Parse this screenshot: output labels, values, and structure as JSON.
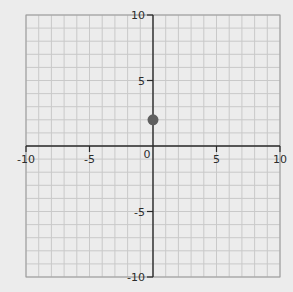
{
  "chart_data": {
    "type": "line",
    "title": "",
    "xlabel": "",
    "ylabel": "",
    "xlim": [
      -10,
      10
    ],
    "ylim": [
      -10,
      10
    ],
    "grid": true,
    "grid_step": 1,
    "x_ticks": [
      -10,
      -5,
      0,
      5,
      10
    ],
    "y_ticks": [
      -10,
      -5,
      5,
      10
    ],
    "x_tick_labels": [
      "-10",
      "-5",
      "0",
      "5",
      "10"
    ],
    "y_tick_labels": [
      "-10",
      "-5",
      "5",
      "10"
    ],
    "origin_label": "0",
    "series": [
      {
        "name": "horizontal line y = 2",
        "kind": "line",
        "x": [
          -10,
          9.5
        ],
        "y": [
          2,
          2
        ],
        "color": "#5a5a5a"
      },
      {
        "name": "point",
        "kind": "point",
        "x": [
          0
        ],
        "y": [
          2
        ],
        "color": "#5f5f5f"
      }
    ],
    "legend": null
  },
  "colors": {
    "background": "#ececec",
    "grid": "#c9c9c9",
    "axis": "#2a2a2a",
    "line": "#5a5a5a",
    "point": "#5f5f5f"
  }
}
